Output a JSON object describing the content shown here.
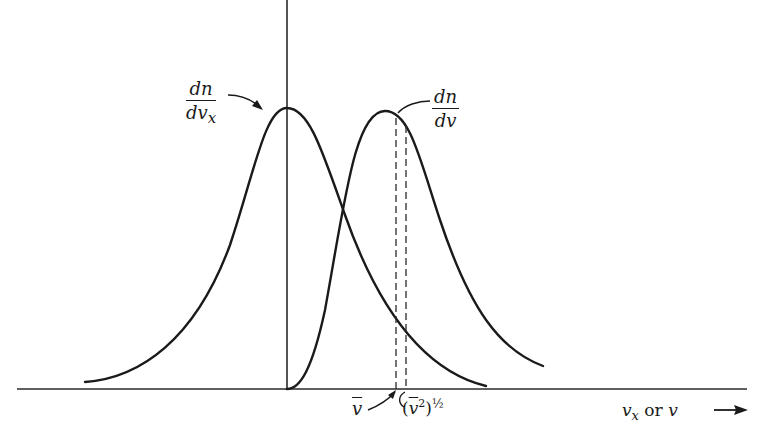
{
  "diagram": {
    "title": "",
    "curves": [
      {
        "id": "component-distribution",
        "label_num": "dn",
        "label_den": "dv",
        "label_den_sub": "x",
        "shape": "gaussian-symmetric",
        "peak_at": "v_x = 0"
      },
      {
        "id": "speed-distribution",
        "label_num": "dn",
        "label_den": "dv",
        "label_den_sub": "",
        "shape": "maxwell-speed",
        "starts_at": "v = 0"
      }
    ],
    "markers": [
      {
        "id": "mean-speed",
        "symbol": "v",
        "overbar": true,
        "style": "dashed"
      },
      {
        "id": "rms-speed",
        "symbol": "(v²)½",
        "style": "dashed"
      }
    ],
    "axis": {
      "x_label_1": "v",
      "x_label_1_sub": "x",
      "x_label_or": " or ",
      "x_label_2": "v",
      "arrow": "→"
    },
    "labels": {
      "mean_symbol": "v",
      "rms_open": "(",
      "rms_symbol": "v",
      "rms_sup": "2",
      "rms_close": ")",
      "rms_exp": "½"
    }
  }
}
